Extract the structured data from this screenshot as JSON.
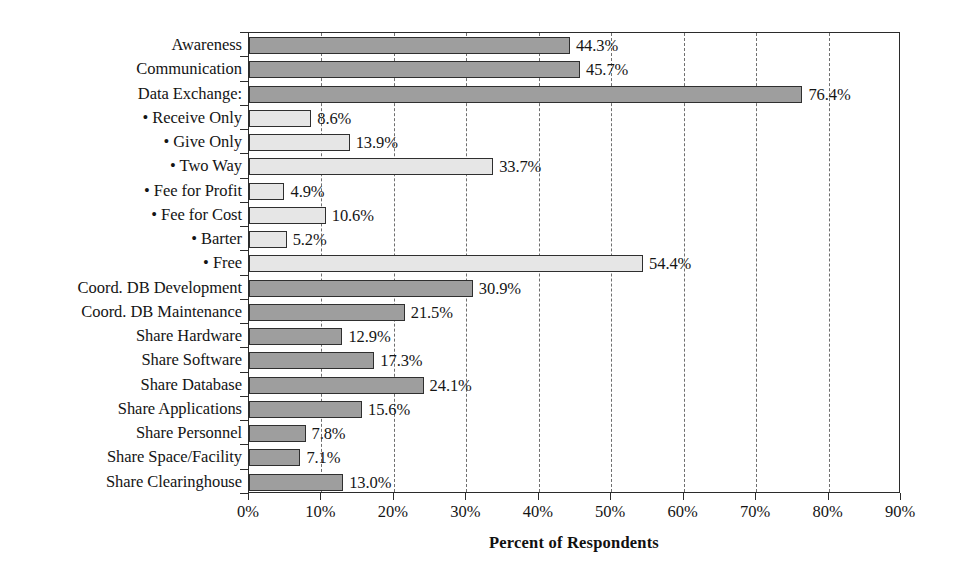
{
  "chart_data": {
    "type": "bar",
    "orientation": "horizontal",
    "title": "",
    "xlabel": "Percent of Respondents",
    "ylabel": "",
    "xlim": [
      0,
      90
    ],
    "xtick_labels": [
      "0%",
      "10%",
      "20%",
      "30%",
      "40%",
      "50%",
      "60%",
      "70%",
      "80%",
      "90%"
    ],
    "xtick_values": [
      0,
      10,
      20,
      30,
      40,
      50,
      60,
      70,
      80,
      90
    ],
    "grid": "vertical-dashed",
    "legend": "none",
    "categories": [
      "Awareness",
      "Communication",
      "Data Exchange:",
      "• Receive Only",
      "• Give Only",
      "• Two Way",
      "• Fee for Profit",
      "• Fee for Cost",
      "• Barter",
      "• Free",
      "Coord. DB Development",
      "Coord. DB Maintenance",
      "Share Hardware",
      "Share Software",
      "Share Database",
      "Share Applications",
      "Share Personnel",
      "Share Space/Facility",
      "Share Clearinghouse"
    ],
    "values": [
      44.3,
      45.7,
      76.4,
      8.6,
      13.9,
      33.7,
      4.9,
      10.6,
      5.2,
      54.4,
      30.9,
      21.5,
      12.9,
      17.3,
      24.1,
      15.6,
      7.8,
      7.1,
      13.0
    ],
    "value_labels": [
      "44.3%",
      "45.7%",
      "76.4%",
      "8.6%",
      "13.9%",
      "33.7%",
      "4.9%",
      "10.6%",
      "5.2%",
      "54.4%",
      "30.9%",
      "21.5%",
      "12.9%",
      "17.3%",
      "24.1%",
      "15.6%",
      "7.8%",
      "7.1%",
      "13.0%"
    ],
    "bar_styles": [
      "dark",
      "dark",
      "dark",
      "light",
      "light",
      "light",
      "light",
      "light",
      "light",
      "light",
      "dark",
      "dark",
      "dark",
      "dark",
      "dark",
      "dark",
      "dark",
      "dark",
      "dark"
    ],
    "colors": {
      "dark_bar": "#9e9e9e",
      "light_bar": "#e6e6e6",
      "bar_border": "#2f2f2f",
      "axis": "#2b2b2b",
      "gridline": "#6f6f6f",
      "text": "#141414",
      "background": "#ffffff"
    }
  }
}
